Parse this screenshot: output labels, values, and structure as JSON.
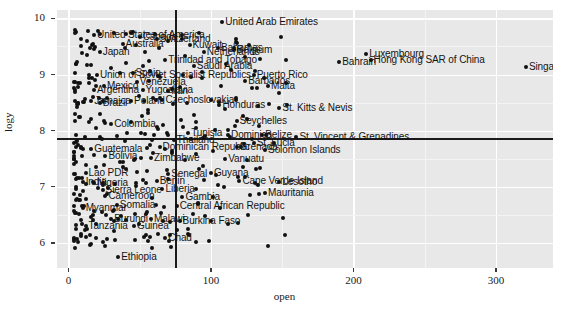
{
  "chart_data": {
    "type": "scatter",
    "title": "",
    "xlabel": "open",
    "ylabel": "logy",
    "xlim": [
      -8,
      340
    ],
    "ylim": [
      5.55,
      10.15
    ],
    "xticks": [
      0,
      100,
      200,
      300
    ],
    "yticks": [
      6,
      7,
      8,
      9,
      10
    ],
    "grid": true,
    "legend": null,
    "reference_lines": {
      "vertical_x": 75,
      "horizontal_y": 7.87
    },
    "labeled_points": [
      {
        "label": "United Arab Emirates",
        "x": 108,
        "y": 9.93
      },
      {
        "label": "United States of America",
        "x": 18,
        "y": 9.71
      },
      {
        "label": "Canada",
        "x": 50,
        "y": 9.66
      },
      {
        "label": "Switzerland",
        "x": 62,
        "y": 9.63
      },
      {
        "label": "Australia",
        "x": 38,
        "y": 9.55
      },
      {
        "label": "Kuwait",
        "x": 85,
        "y": 9.53
      },
      {
        "label": "Bahamas",
        "x": 105,
        "y": 9.47
      },
      {
        "label": "Japan",
        "x": 22,
        "y": 9.41
      },
      {
        "label": "Luxembourg",
        "x": 209,
        "y": 9.36
      },
      {
        "label": "Netherlands",
        "x": 95,
        "y": 9.4
      },
      {
        "label": "Belgium",
        "x": 116,
        "y": 9.43
      },
      {
        "label": "Hong Kong SAR of China",
        "x": 212,
        "y": 9.25
      },
      {
        "label": "Bahrain",
        "x": 190,
        "y": 9.22
      },
      {
        "label": "Trinidad and Tobago",
        "x": 68,
        "y": 9.25
      },
      {
        "label": "Saudi Arabia",
        "x": 88,
        "y": 9.15
      },
      {
        "label": "Singapore",
        "x": 321,
        "y": 9.13
      },
      {
        "label": "Union of Soviet Socialist Republics",
        "x": 20,
        "y": 9.0
      },
      {
        "label": "Spain",
        "x": 45,
        "y": 9.02
      },
      {
        "label": "Puerto Rico",
        "x": 130,
        "y": 9.0
      },
      {
        "label": "Barbados",
        "x": 124,
        "y": 8.88
      },
      {
        "label": "Venezuela",
        "x": 48,
        "y": 8.86
      },
      {
        "label": "Mexico",
        "x": 25,
        "y": 8.8
      },
      {
        "label": "Malta",
        "x": 140,
        "y": 8.79
      },
      {
        "label": "Argentina",
        "x": 18,
        "y": 8.72
      },
      {
        "label": "Yugoslavia",
        "x": 52,
        "y": 8.73
      },
      {
        "label": "Iran",
        "x": 70,
        "y": 8.7
      },
      {
        "label": "Jamaica",
        "x": 16,
        "y": 8.52
      },
      {
        "label": "Brazil",
        "x": 22,
        "y": 8.5
      },
      {
        "label": "Poland",
        "x": 44,
        "y": 8.52
      },
      {
        "label": "Czechoslovakia",
        "x": 66,
        "y": 8.54
      },
      {
        "label": "Honduras",
        "x": 106,
        "y": 8.45
      },
      {
        "label": "St. Kitts & Nevis",
        "x": 148,
        "y": 8.4
      },
      {
        "label": "Colombia",
        "x": 30,
        "y": 8.12
      },
      {
        "label": "Seychelles",
        "x": 118,
        "y": 8.17
      },
      {
        "label": "Tunisia",
        "x": 84,
        "y": 7.96
      },
      {
        "label": "Dominica",
        "x": 112,
        "y": 7.92
      },
      {
        "label": "Belize",
        "x": 136,
        "y": 7.93
      },
      {
        "label": "St. Vincent & Grenadines",
        "x": 160,
        "y": 7.88
      },
      {
        "label": "Thailand",
        "x": 74,
        "y": 7.84
      },
      {
        "label": "St. Lucia",
        "x": 130,
        "y": 7.78
      },
      {
        "label": "Guatemala",
        "x": 16,
        "y": 7.68
      },
      {
        "label": "Dominican Republic",
        "x": 64,
        "y": 7.7
      },
      {
        "label": "Grenada",
        "x": 118,
        "y": 7.7
      },
      {
        "label": "Solomon Islands",
        "x": 138,
        "y": 7.66
      },
      {
        "label": "Bolivia",
        "x": 26,
        "y": 7.55
      },
      {
        "label": "Zimbabwe",
        "x": 58,
        "y": 7.52
      },
      {
        "label": "Vanuatu",
        "x": 110,
        "y": 7.49
      },
      {
        "label": "Lao PDR",
        "x": 12,
        "y": 7.25
      },
      {
        "label": "Senegal",
        "x": 70,
        "y": 7.22
      },
      {
        "label": "Guyana",
        "x": 100,
        "y": 7.25
      },
      {
        "label": "India",
        "x": 10,
        "y": 7.08
      },
      {
        "label": "Nigeria",
        "x": 18,
        "y": 7.06
      },
      {
        "label": "Benin",
        "x": 62,
        "y": 7.1
      },
      {
        "label": "Cape Verde Island",
        "x": 120,
        "y": 7.1
      },
      {
        "label": "Lesotho",
        "x": 148,
        "y": 7.08
      },
      {
        "label": "Sierra Leone",
        "x": 24,
        "y": 6.94
      },
      {
        "label": "Liberia",
        "x": 66,
        "y": 6.95
      },
      {
        "label": "Mauritania",
        "x": 138,
        "y": 6.88
      },
      {
        "label": "Cameroon",
        "x": 26,
        "y": 6.83
      },
      {
        "label": "Gambia",
        "x": 80,
        "y": 6.82
      },
      {
        "label": "Somalia",
        "x": 34,
        "y": 6.68
      },
      {
        "label": "Central African Republic",
        "x": 76,
        "y": 6.66
      },
      {
        "label": "Myanmar",
        "x": 10,
        "y": 6.62
      },
      {
        "label": "Burundi",
        "x": 30,
        "y": 6.42
      },
      {
        "label": "Malawi",
        "x": 58,
        "y": 6.42
      },
      {
        "label": "Burkina Faso",
        "x": 78,
        "y": 6.38
      },
      {
        "label": "Tanzania",
        "x": 12,
        "y": 6.3
      },
      {
        "label": "Guinea",
        "x": 46,
        "y": 6.3
      },
      {
        "label": "Chad",
        "x": 68,
        "y": 6.09
      },
      {
        "label": "Ethiopia",
        "x": 35,
        "y": 5.74
      }
    ]
  },
  "axis": {
    "y_tick_labels": [
      "10",
      "9",
      "8",
      "7",
      "6"
    ],
    "x_tick_labels": [
      "0",
      "100",
      "200",
      "300"
    ],
    "y_axis_title": "logy",
    "x_axis_title": "open"
  },
  "caption": {
    "text": ""
  },
  "colors": {
    "panel_background": "#e8e8e8",
    "major_gridline": "#ffffff",
    "minor_gridline": "#f4f4f4",
    "point": "#111111",
    "reference_line": "#1a1a1a",
    "text": "#141414"
  }
}
